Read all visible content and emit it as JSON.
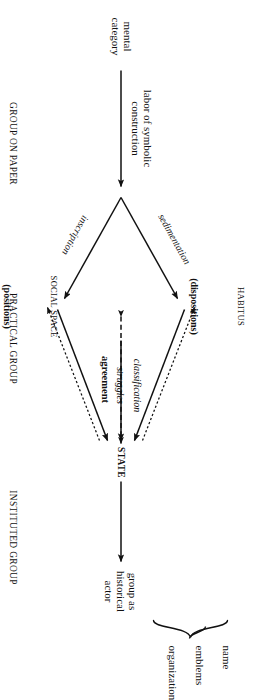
{
  "diagram": {
    "orientation": "rotated-90-clockwise",
    "nodes": {
      "mental_category": "mental\ncategory",
      "habitus_title": "HABITUS",
      "habitus_sub": "(dispositions)",
      "social_space_title": "SOCIAL SPACE",
      "social_space_sub": "(positions)",
      "state": "STATE",
      "group_actor": "group as\nhistorical\nactor"
    },
    "edges": {
      "labor": "labor of symbolic\nconstruction",
      "sedimentation": "sedimentation",
      "inscription": "inscription",
      "agreement": "agreement",
      "classification": "classification",
      "struggles": "struggles"
    },
    "brace_items": [
      "name",
      "emblems",
      "organization"
    ],
    "footer": [
      "GROUP ON PAPER",
      "PRACTICAL GROUP",
      "INSTITUTED GROUP"
    ],
    "colors": {
      "ink": "#111111",
      "paper": "#ffffff"
    }
  }
}
